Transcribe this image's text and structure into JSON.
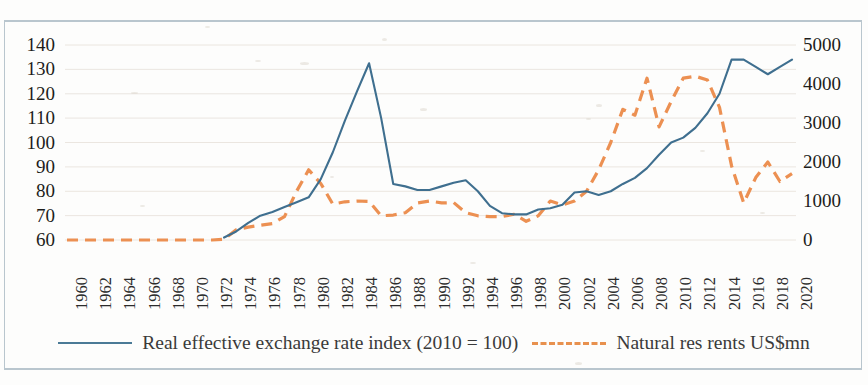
{
  "chart_data": {
    "type": "line",
    "title": "",
    "xlabel": "",
    "grid": true,
    "legend_position": "bottom",
    "x": [
      1960,
      1961,
      1962,
      1963,
      1964,
      1965,
      1966,
      1967,
      1968,
      1969,
      1970,
      1971,
      1972,
      1973,
      1974,
      1975,
      1976,
      1977,
      1978,
      1979,
      1980,
      1981,
      1982,
      1983,
      1984,
      1985,
      1986,
      1987,
      1988,
      1989,
      1990,
      1991,
      1992,
      1993,
      1994,
      1995,
      1996,
      1997,
      1998,
      1999,
      2000,
      2001,
      2002,
      2003,
      2004,
      2005,
      2006,
      2007,
      2008,
      2009,
      2010,
      2011,
      2012,
      2013,
      2014,
      2015,
      2016,
      2017,
      2018,
      2019,
      2020
    ],
    "tick_labels_x": [
      "1960",
      "1962",
      "1964",
      "1966",
      "1968",
      "1970",
      "1972",
      "1974",
      "1976",
      "1978",
      "1980",
      "1982",
      "1984",
      "1986",
      "1988",
      "1990",
      "1992",
      "1994",
      "1996",
      "1998",
      "2000",
      "2002",
      "2004",
      "2006",
      "2008",
      "2010",
      "2012",
      "2014",
      "2016",
      "2018",
      "2020"
    ],
    "axes": [
      {
        "id": "left",
        "ylabel": "",
        "ylim": [
          60,
          140
        ],
        "ticks": [
          60,
          70,
          80,
          90,
          100,
          110,
          120,
          130,
          140
        ],
        "tick_labels": [
          "60",
          "70",
          "80",
          "90",
          "100",
          "110",
          "120",
          "130",
          "140"
        ]
      },
      {
        "id": "right",
        "ylabel": "",
        "ylim": [
          0,
          5000
        ],
        "ticks": [
          0,
          1000,
          2000,
          3000,
          4000,
          5000
        ],
        "tick_labels": [
          "0",
          "1000",
          "2000",
          "3000",
          "4000",
          "5000"
        ]
      }
    ],
    "series": [
      {
        "name": "Real effective exchange rate index (2010 = 100)",
        "axis": "left",
        "color": "#3f6f8f",
        "style": "solid",
        "x": [
          1973,
          1974,
          1975,
          1976,
          1977,
          1978,
          1979,
          1980,
          1981,
          1982,
          1983,
          1984,
          1985,
          1986,
          1987,
          1988,
          1989,
          1990,
          1991,
          1992,
          1993,
          1994,
          1995,
          1996,
          1997,
          1998,
          1999,
          2000,
          2001,
          2002,
          2003,
          2004,
          2005,
          2006,
          2007,
          2008,
          2009,
          2010,
          2011,
          2012,
          2013,
          2014,
          2015,
          2016,
          2017,
          2018,
          2019,
          2020
        ],
        "values": [
          61,
          63.5,
          67,
          70,
          71.5,
          73.5,
          75.5,
          77.5,
          85,
          96,
          109,
          121,
          132.5,
          110,
          83,
          82,
          80.5,
          80.5,
          82,
          83.5,
          84.5,
          80,
          74,
          71,
          70.5,
          70.5,
          72.5,
          73,
          74.5,
          79.5,
          80,
          78.5,
          80,
          83,
          85.5,
          89.5,
          95,
          100,
          102,
          106,
          112,
          120,
          134,
          134,
          131,
          128,
          131,
          134
        ]
      },
      {
        "name": "Natural res rents US$mn",
        "axis": "right",
        "color": "#ec9052",
        "style": "dashed",
        "x": [
          1960,
          1961,
          1962,
          1963,
          1964,
          1965,
          1966,
          1967,
          1968,
          1969,
          1970,
          1971,
          1972,
          1973,
          1974,
          1975,
          1976,
          1977,
          1978,
          1979,
          1980,
          1981,
          1982,
          1983,
          1984,
          1985,
          1986,
          1987,
          1988,
          1989,
          1990,
          1991,
          1992,
          1993,
          1994,
          1995,
          1996,
          1997,
          1998,
          1999,
          2000,
          2001,
          2002,
          2003,
          2004,
          2005,
          2006,
          2007,
          2008,
          2009,
          2010,
          2011,
          2012,
          2013,
          2014,
          2015,
          2016,
          2017,
          2018,
          2019,
          2020
        ],
        "values": [
          0,
          0,
          0,
          0,
          0,
          0,
          0,
          0,
          0,
          0,
          0,
          0,
          0,
          20,
          260,
          330,
          380,
          420,
          600,
          1250,
          1800,
          1450,
          920,
          980,
          1000,
          990,
          620,
          640,
          700,
          950,
          1000,
          950,
          960,
          700,
          620,
          600,
          600,
          660,
          480,
          620,
          1000,
          900,
          1000,
          1250,
          1800,
          2500,
          3350,
          3200,
          4150,
          2900,
          3550,
          4150,
          4200,
          4100,
          3400,
          1900,
          950,
          1600,
          2000,
          1500,
          1700
        ]
      }
    ],
    "legend": [
      {
        "label": "Real effective exchange rate index (2010 = 100)",
        "marker": "solid-line",
        "color": "#3f6f8f"
      },
      {
        "label": "Natural res rents US$mn",
        "marker": "dashed-line",
        "color": "#ec9052"
      }
    ]
  }
}
